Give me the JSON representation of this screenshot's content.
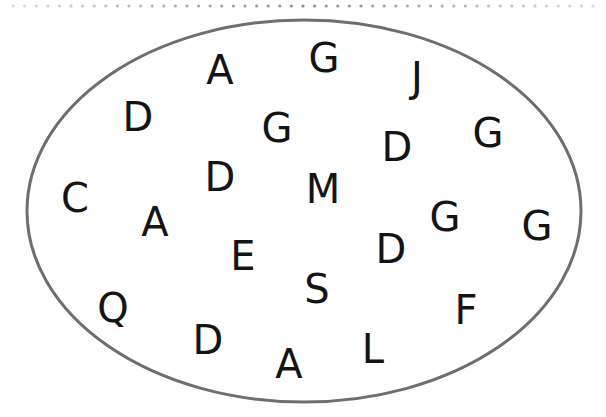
{
  "diagram": {
    "type": "set-ellipse",
    "ellipse": {
      "cx": 304,
      "cy": 211,
      "rx": 277,
      "ry": 191,
      "stroke": "#6e6e6e",
      "stroke_width": 3
    },
    "dots_row": {
      "y": 6,
      "start_x": 13,
      "spacing": 11.6,
      "count": 51,
      "color": "#7a7a7a"
    },
    "letters": [
      {
        "char": "A",
        "x": 220,
        "y": 70
      },
      {
        "char": "G",
        "x": 324,
        "y": 58
      },
      {
        "char": "J",
        "x": 417,
        "y": 77
      },
      {
        "char": "D",
        "x": 138,
        "y": 117
      },
      {
        "char": "G",
        "x": 277,
        "y": 128
      },
      {
        "char": "D",
        "x": 397,
        "y": 147
      },
      {
        "char": "G",
        "x": 488,
        "y": 133
      },
      {
        "char": "D",
        "x": 220,
        "y": 177
      },
      {
        "char": "M",
        "x": 323,
        "y": 189
      },
      {
        "char": "C",
        "x": 75,
        "y": 198
      },
      {
        "char": "A",
        "x": 155,
        "y": 222
      },
      {
        "char": "G",
        "x": 445,
        "y": 217
      },
      {
        "char": "G",
        "x": 537,
        "y": 226
      },
      {
        "char": "E",
        "x": 243,
        "y": 256
      },
      {
        "char": "D",
        "x": 391,
        "y": 249
      },
      {
        "char": "S",
        "x": 317,
        "y": 289
      },
      {
        "char": "Q",
        "x": 113,
        "y": 308
      },
      {
        "char": "F",
        "x": 466,
        "y": 310
      },
      {
        "char": "D",
        "x": 208,
        "y": 340
      },
      {
        "char": "L",
        "x": 373,
        "y": 349
      },
      {
        "char": "A",
        "x": 289,
        "y": 364
      }
    ]
  }
}
